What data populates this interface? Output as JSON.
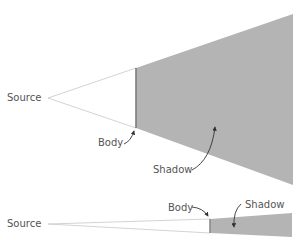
{
  "colors": {
    "shadow_fill": "#b4b4b4",
    "body_edge": "#7a7a7a",
    "ray_stroke": "#c8c8c8",
    "label": "#555555",
    "arrow": "#333333"
  },
  "top_diagram": {
    "source_label": "Source",
    "body_label": "Body",
    "shadow_label": "Shadow",
    "source_point": [
      48,
      98
    ],
    "body_edge": {
      "x": 136,
      "top": 68,
      "bottom": 128
    },
    "shadow_far_edge": {
      "x": 293,
      "top": 14,
      "bottom": 185
    }
  },
  "bottom_diagram": {
    "source_label": "Source",
    "body_label": "Body",
    "shadow_label": "Shadow",
    "source_point": [
      48,
      224
    ],
    "body_edge": {
      "x": 210,
      "top": 219,
      "bottom": 233
    },
    "shadow_far_edge": {
      "x": 292,
      "top": 213,
      "bottom": 237
    }
  }
}
